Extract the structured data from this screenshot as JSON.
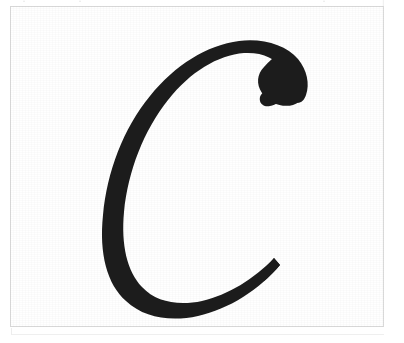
{
  "document": {
    "kind": "scanned-glyph-specimen",
    "caption": "",
    "background_color": "#ffffff"
  },
  "frame": {
    "name": "specimen-border",
    "border_color": "#dbdbdb",
    "fill_color": "#ffffff",
    "x": 10,
    "y": 6,
    "width": 374,
    "height": 321
  },
  "ghost_strip": {
    "description": "faint clipped remnants of a scanned text line above the frame",
    "color": "#dcdcdc",
    "marks": [
      {
        "text": "·"
      },
      {
        "text": "·"
      },
      {
        "text": "·"
      },
      {
        "text": "|"
      }
    ]
  },
  "glyph": {
    "character": "C",
    "style": "italic-serif",
    "ink_color": "#1c1c1c",
    "paper_color": "#ffffff",
    "bounds": {
      "left": 88,
      "top": 38,
      "right": 300,
      "bottom": 312
    }
  },
  "artifacts": {
    "bottom_edge_color": "#efefef",
    "tick_color": "#ededed"
  }
}
